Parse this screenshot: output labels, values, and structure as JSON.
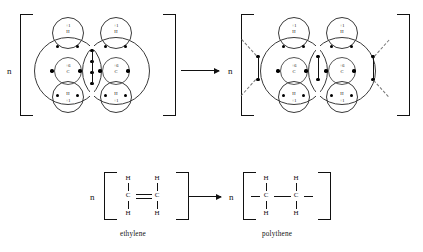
{
  "diagram": {
    "top_row": {
      "left_structure": {
        "name": "ethylene-bohr-model",
        "multiplier": "n",
        "carbons": [
          {
            "label": "C",
            "charge": "+6"
          },
          {
            "label": "C",
            "charge": "+6"
          }
        ],
        "hydrogens": [
          {
            "label": "H",
            "charge": "+1",
            "position": "top-left"
          },
          {
            "label": "H",
            "charge": "+1",
            "position": "top-right"
          },
          {
            "label": "H",
            "charge": "+1",
            "position": "bottom-left"
          },
          {
            "label": "H",
            "charge": "+1",
            "position": "bottom-right"
          }
        ],
        "shared_electron_pairs": 2,
        "bond_type": "double"
      },
      "right_structure": {
        "name": "polythene-bohr-model",
        "multiplier": "n",
        "carbons": [
          {
            "label": "C",
            "charge": "+6"
          },
          {
            "label": "C",
            "charge": "+6"
          }
        ],
        "hydrogens": [
          {
            "label": "H",
            "charge": "+1",
            "position": "top-left"
          },
          {
            "label": "H",
            "charge": "+1",
            "position": "top-right"
          },
          {
            "label": "H",
            "charge": "+1",
            "position": "bottom-left"
          },
          {
            "label": "H",
            "charge": "+1",
            "position": "bottom-right"
          }
        ],
        "shared_electron_pairs": 1,
        "bond_type": "single",
        "chain_extensions": "dashed"
      },
      "arrow": "→"
    },
    "bottom_row": {
      "left_formula": {
        "multiplier": "n",
        "caption": "ethylene",
        "atoms": {
          "carbon": "C",
          "hydrogen": "H"
        },
        "bond": "double"
      },
      "right_formula": {
        "multiplier": "n",
        "caption": "polythene",
        "atoms": {
          "carbon": "C",
          "hydrogen": "H"
        },
        "bond": "single"
      },
      "arrow": "→"
    }
  },
  "colors": {
    "ink": "#111111",
    "shell_stroke": "#3a3a3a",
    "dashed": "#777777",
    "background": "#ffffff"
  }
}
